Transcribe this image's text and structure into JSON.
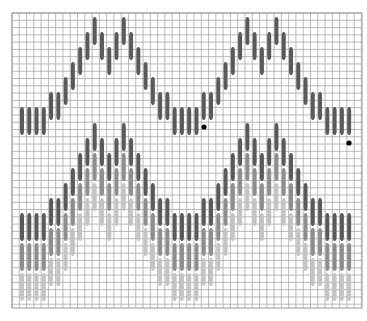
{
  "diagram": {
    "type": "bargello-stitch-chart",
    "grid": {
      "x0": 12,
      "y0": 13,
      "x1": 362,
      "y1": 308,
      "cell": 7.28,
      "line_color": "#a8a8a8",
      "border_color": "#9a9a9a",
      "background": "#ffffff"
    },
    "stitch": {
      "first_x": 22,
      "col_step": 7.27,
      "width": 4,
      "height": 28,
      "level_step": 15
    },
    "column_levels": [
      0,
      0,
      0,
      0,
      1,
      1,
      2,
      3,
      4,
      5,
      6,
      5,
      4,
      5,
      6,
      5,
      4,
      3,
      2,
      1,
      1,
      0,
      0,
      0,
      0,
      1,
      1,
      2,
      3,
      4,
      5,
      6,
      5,
      4,
      5,
      6,
      5,
      4,
      3,
      2,
      1,
      1,
      0,
      0,
      0,
      0
    ],
    "bands": [
      {
        "name": "upper-band",
        "base_top": 107,
        "rows": [
          {
            "color": "#5a5a5a",
            "offset": 0
          }
        ]
      },
      {
        "name": "lower-band",
        "base_top": 213,
        "rows": [
          {
            "color": "#5a5a5a",
            "offset": 0
          },
          {
            "color": "#8e8e8e",
            "offset": 30
          },
          {
            "color": "#c4c4c4",
            "offset": 60
          }
        ]
      }
    ],
    "markers": [
      {
        "name": "start-dot",
        "x": 204,
        "y": 127,
        "r": 2.6,
        "color": "#000000"
      },
      {
        "name": "end-dot",
        "x": 349,
        "y": 143,
        "r": 2.6,
        "color": "#000000"
      }
    ]
  }
}
